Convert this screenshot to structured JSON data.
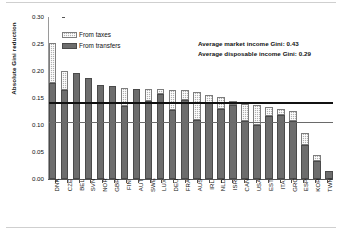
{
  "chart_data": {
    "type": "bar",
    "subtype": "stacked-bar",
    "title": "",
    "xlabel": "",
    "ylabel": "Absolute Gini reduction",
    "ylim": [
      0.0,
      0.3
    ],
    "ytick_labels": [
      "0.30",
      "0.25",
      "0.20",
      "0.15",
      "0.10",
      "0.05",
      "0.00"
    ],
    "ytick_values": [
      0.3,
      0.25,
      0.2,
      0.15,
      0.1,
      0.05,
      0.0
    ],
    "grid": false,
    "legend_position": "upper-left-inside",
    "categories": [
      "DNK",
      "CZE",
      "BEL",
      "SVN",
      "NOR",
      "GBR",
      "FIN",
      "AUT",
      "SWE",
      "LUX",
      "DEU",
      "FRA",
      "AUS",
      "IRL",
      "NLD",
      "ISR",
      "CAN",
      "USA",
      "EST",
      "ITA",
      "GRC",
      "ESP",
      "KOR",
      "TWN"
    ],
    "series": [
      {
        "name": "From transfers",
        "color": "#6d6d6d",
        "values": [
          0.177,
          0.164,
          0.197,
          0.187,
          0.174,
          0.172,
          0.135,
          0.167,
          0.144,
          0.158,
          0.128,
          0.147,
          0.11,
          0.14,
          0.13,
          0.137,
          0.107,
          0.1,
          0.116,
          0.118,
          0.108,
          0.063,
          0.034,
          0.014
        ]
      },
      {
        "name": "From taxes",
        "color": "#b0b0b0",
        "values": [
          0.075,
          0.036,
          0.0,
          0.0,
          0.0,
          0.0,
          0.033,
          0.0,
          0.022,
          0.008,
          0.037,
          0.017,
          0.052,
          0.015,
          0.022,
          0.008,
          0.032,
          0.037,
          0.018,
          0.012,
          0.018,
          0.022,
          0.01,
          0.0
        ]
      }
    ],
    "totals": [
      0.252,
      0.2,
      0.197,
      0.187,
      0.174,
      0.172,
      0.168,
      0.167,
      0.166,
      0.166,
      0.165,
      0.164,
      0.162,
      0.155,
      0.152,
      0.145,
      0.139,
      0.137,
      0.134,
      0.13,
      0.126,
      0.085,
      0.044,
      0.014
    ],
    "reference_lines": [
      {
        "name": "average-market-income-gini",
        "value": 0.14,
        "color": "#111111",
        "width_px": 2
      },
      {
        "name": "average-disposable-income-gini",
        "value": 0.105,
        "color": "#6a6a6a",
        "width_px": 1
      }
    ],
    "annotations": [
      "Average market income Gini: 0.43",
      "Average disposable income Gini: 0.29"
    ]
  },
  "legend": {
    "items": [
      {
        "label": "From taxes",
        "key": "taxes"
      },
      {
        "label": "From transfers",
        "key": "transfers"
      }
    ]
  }
}
